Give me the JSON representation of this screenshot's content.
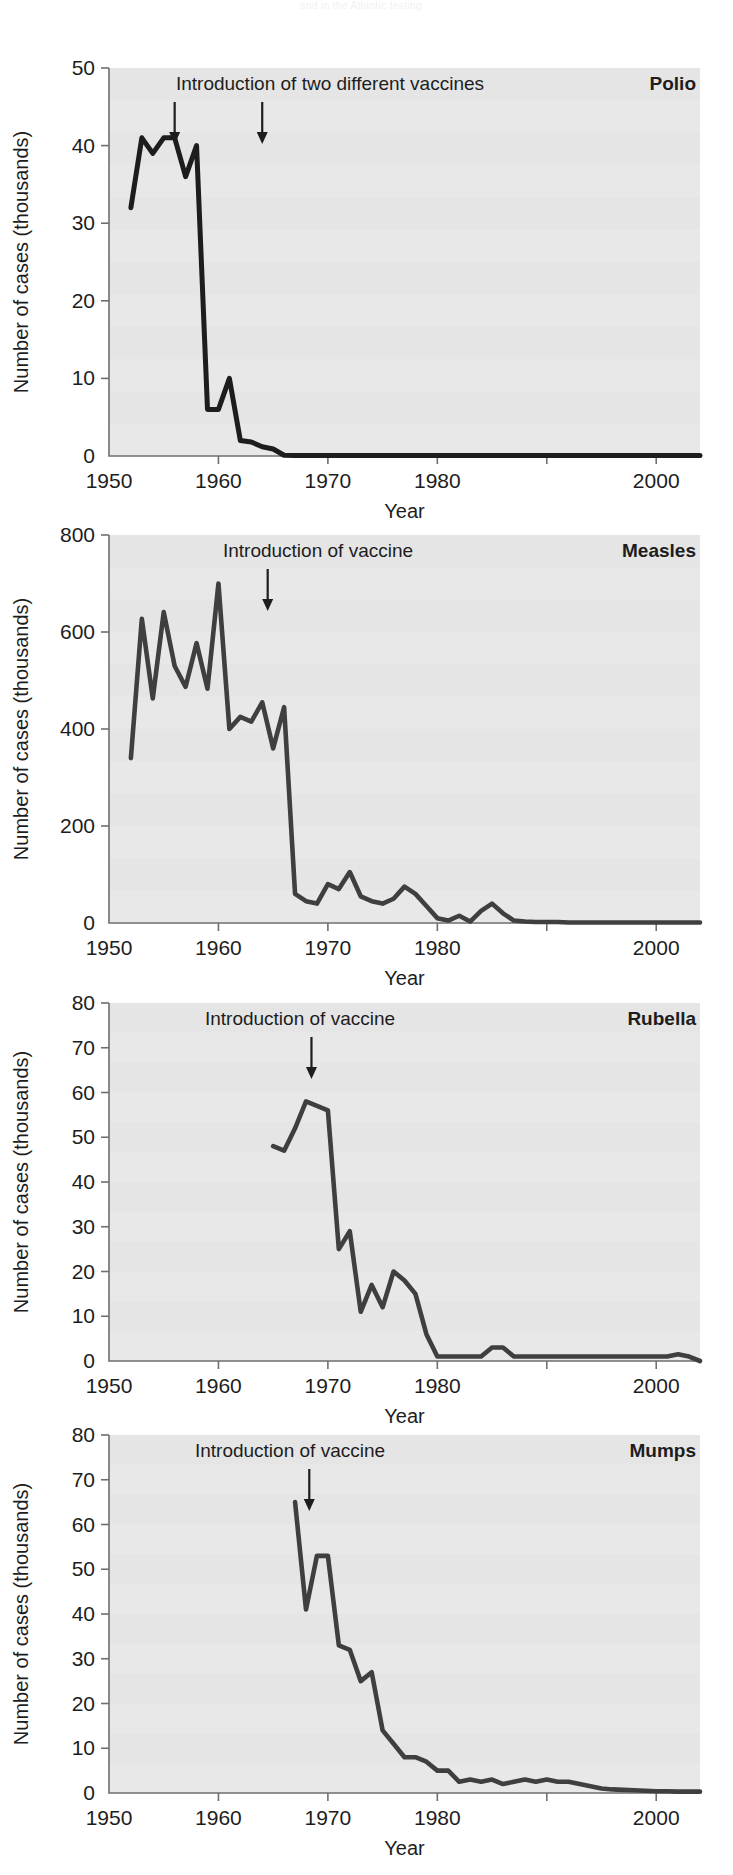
{
  "figure": {
    "faint_header_artifact": "and in the Atlantic testing",
    "common": {
      "ylabel": "Number of cases (thousands)",
      "xlabel": "Year",
      "x_ticks": [
        1950,
        1960,
        1970,
        1980,
        1990,
        2000
      ],
      "x_tick_labels": [
        "1950",
        "1960",
        "1970",
        "1980",
        "",
        "2000"
      ],
      "xlim": [
        1950,
        2004
      ],
      "line_color": "#3f3f3f",
      "polio_line_color": "#1d1d1d",
      "plot_bg": "#e8e8e8",
      "axis_color": "#6f6f6f",
      "text_color": "#1d1d1d"
    }
  },
  "chart_data": [
    {
      "type": "line",
      "title": "Polio",
      "annotation": "Introduction of two different vaccines",
      "annotation_arrows_at_years": [
        1956,
        1964
      ],
      "xlabel": "Year",
      "ylabel": "Number of cases (thousands)",
      "xlim": [
        1950,
        2004
      ],
      "ylim": [
        0,
        50
      ],
      "y_ticks": [
        0,
        10,
        20,
        30,
        40,
        50
      ],
      "y_tick_labels": [
        "0",
        "10",
        "20",
        "30",
        "40",
        "50"
      ],
      "grid": false,
      "x": [
        1952,
        1953,
        1954,
        1955,
        1956,
        1957,
        1958,
        1959,
        1960,
        1961,
        1962,
        1963,
        1964,
        1965,
        1966,
        1967,
        1968,
        1969,
        1970,
        1971,
        1972,
        1973,
        1974,
        1975,
        1976,
        1977,
        1978,
        1979,
        1980,
        1981,
        1982,
        1983,
        1984,
        1985,
        1986,
        1987,
        1988,
        1989,
        1990,
        1991,
        1992,
        1993,
        1994,
        1995,
        1996,
        1997,
        1998,
        1999,
        2000,
        2001,
        2002,
        2003,
        2004
      ],
      "values": [
        32,
        41,
        39,
        41,
        41,
        36,
        40,
        6,
        6,
        10,
        2,
        1.8,
        1.2,
        0.9,
        0.1,
        0.05,
        0.05,
        0.05,
        0.05,
        0.05,
        0.05,
        0.05,
        0.05,
        0.05,
        0.05,
        0.05,
        0.05,
        0.05,
        0.05,
        0.05,
        0.05,
        0.05,
        0.05,
        0.05,
        0.05,
        0.05,
        0.05,
        0.05,
        0.05,
        0.05,
        0.05,
        0.05,
        0.05,
        0.05,
        0.05,
        0.05,
        0.05,
        0.05,
        0.05,
        0.05,
        0.05,
        0.05,
        0.05
      ]
    },
    {
      "type": "line",
      "title": "Measles",
      "annotation": "Introduction of vaccine",
      "annotation_arrows_at_years": [
        1964.5
      ],
      "xlabel": "Year",
      "ylabel": "Number of cases (thousands)",
      "xlim": [
        1950,
        2004
      ],
      "ylim": [
        0,
        800
      ],
      "y_ticks": [
        0,
        200,
        400,
        600,
        800
      ],
      "y_tick_labels": [
        "0",
        "200",
        "400",
        "600",
        "800"
      ],
      "grid": false,
      "x": [
        1952,
        1953,
        1954,
        1955,
        1956,
        1957,
        1958,
        1959,
        1960,
        1961,
        1962,
        1963,
        1964,
        1965,
        1966,
        1967,
        1968,
        1969,
        1970,
        1971,
        1972,
        1973,
        1974,
        1975,
        1976,
        1977,
        1978,
        1979,
        1980,
        1981,
        1982,
        1983,
        1984,
        1985,
        1986,
        1987,
        1988,
        1989,
        1990,
        1991,
        1992,
        1993,
        1994,
        1995,
        1996,
        1997,
        1998,
        1999,
        2000,
        2001,
        2002,
        2003,
        2004
      ],
      "values": [
        340,
        627,
        463,
        641,
        530,
        487,
        577,
        483,
        700,
        400,
        425,
        415,
        455,
        360,
        445,
        60,
        45,
        40,
        80,
        70,
        105,
        55,
        45,
        40,
        50,
        75,
        60,
        35,
        10,
        5,
        15,
        3,
        25,
        40,
        20,
        5,
        3,
        2,
        2,
        2,
        1,
        1,
        1,
        1,
        1,
        1,
        1,
        1,
        1,
        1,
        1,
        1,
        1
      ]
    },
    {
      "type": "line",
      "title": "Rubella",
      "annotation": "Introduction of vaccine",
      "annotation_arrows_at_years": [
        1968.5
      ],
      "xlabel": "Year",
      "ylabel": "Number of cases (thousands)",
      "xlim": [
        1950,
        2004
      ],
      "ylim": [
        0,
        80
      ],
      "y_ticks": [
        0,
        10,
        20,
        30,
        40,
        50,
        60,
        70,
        80
      ],
      "y_tick_labels": [
        "0",
        "10",
        "20",
        "30",
        "40",
        "50",
        "60",
        "70",
        "80"
      ],
      "grid": false,
      "x": [
        1965,
        1966,
        1967,
        1968,
        1969,
        1970,
        1971,
        1972,
        1973,
        1974,
        1975,
        1976,
        1977,
        1978,
        1979,
        1980,
        1981,
        1982,
        1983,
        1984,
        1985,
        1986,
        1987,
        1988,
        1989,
        1990,
        1991,
        1992,
        1993,
        1994,
        1995,
        1996,
        1997,
        1998,
        1999,
        2000,
        2001,
        2002,
        2003,
        2004
      ],
      "values": [
        48,
        47,
        52,
        58,
        57,
        56,
        25,
        29,
        11,
        17,
        12,
        20,
        18,
        15,
        6,
        1,
        1,
        1,
        1,
        1,
        3,
        3,
        1,
        1,
        1,
        1,
        1,
        1,
        1,
        1,
        1,
        1,
        1,
        1,
        1,
        1,
        1,
        1.5,
        1,
        0
      ]
    },
    {
      "type": "line",
      "title": "Mumps",
      "annotation": "Introduction of vaccine",
      "annotation_arrows_at_years": [
        1968.3
      ],
      "xlabel": "Year",
      "ylabel": "Number of cases (thousands)",
      "xlim": [
        1950,
        2004
      ],
      "ylim": [
        0,
        80
      ],
      "y_ticks": [
        0,
        10,
        20,
        30,
        40,
        50,
        60,
        70,
        80
      ],
      "y_tick_labels": [
        "0",
        "10",
        "20",
        "30",
        "40",
        "50",
        "60",
        "70",
        "80"
      ],
      "grid": false,
      "x": [
        1967,
        1968,
        1969,
        1970,
        1971,
        1972,
        1973,
        1974,
        1975,
        1976,
        1977,
        1978,
        1979,
        1980,
        1981,
        1982,
        1983,
        1984,
        1985,
        1986,
        1987,
        1988,
        1989,
        1990,
        1991,
        1992,
        1993,
        1994,
        1995,
        1996,
        1997,
        1998,
        1999,
        2000,
        2001,
        2002,
        2003,
        2004
      ],
      "values": [
        65,
        41,
        53,
        53,
        33,
        32,
        25,
        27,
        14,
        11,
        8,
        8,
        7,
        5,
        5,
        2.5,
        3,
        2.5,
        3,
        2,
        2.5,
        3,
        2.5,
        3,
        2.5,
        2.5,
        2,
        1.5,
        1,
        0.8,
        0.7,
        0.6,
        0.5,
        0.4,
        0.4,
        0.3,
        0.3,
        0.3
      ]
    }
  ]
}
